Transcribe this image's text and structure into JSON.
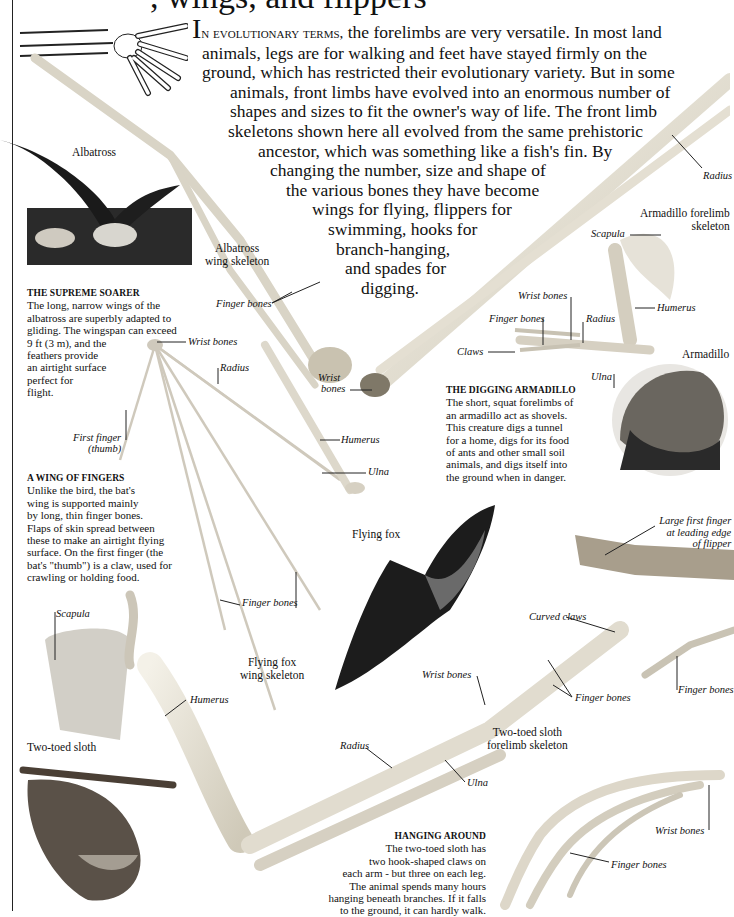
{
  "page": {
    "title_fragment": ", wings, and flippers",
    "intro": {
      "dropcap": "I",
      "lead_smallcaps": "n evolutionary terms,",
      "lines": [
        " the forelimbs are very versatile. In most land",
        "animals, legs are for walking and feet have stayed firmly on the",
        "ground, which has restricted their evolutionary variety. But in some",
        "animals, front limbs have evolved into an enormous number of",
        "shapes and sizes to fit the owner's way of life. The front limb",
        "skeletons shown here all evolved from the same prehistoric",
        "ancestor, which was something like a fish's fin. By",
        "changing the number, size and shape of",
        "the various bones they have become",
        "wings for flying, flippers for",
        "swimming, hooks for",
        "branch-hanging,",
        "and spades for",
        "digging."
      ]
    },
    "boxes": {
      "albatross": {
        "heading": "THE SUPREME SOARER",
        "lines": [
          "The long, narrow wings of the",
          "albatross are superbly adapted to",
          "gliding. The wingspan can exceed",
          "9 ft (3 m), and the",
          "feathers provide",
          "an airtight surface",
          "perfect for",
          "flight."
        ]
      },
      "bat": {
        "heading": "A WING OF FINGERS",
        "lines": [
          "Unlike the bird, the bat's",
          "wing is supported mainly",
          "by long, thin finger bones.",
          "Flaps of skin spread between",
          "these to make an airtight flying",
          "surface. On the first finger (the",
          "bat's \"thumb\") is a claw, used for",
          "crawling or holding food."
        ]
      },
      "armadillo": {
        "heading": "THE DIGGING ARMADILLO",
        "lines": [
          "The short, squat forelimbs of",
          "an armadillo act as shovels.",
          "This creature digs a tunnel",
          "for a home, digs for its food",
          "of ants and other small soil",
          "animals, and digs itself into",
          "the ground when in danger."
        ]
      },
      "sloth": {
        "heading": "HANGING AROUND",
        "lines": [
          "The two-toed sloth has",
          "two hook-shaped claws on",
          "each arm - but three on each leg.",
          "The animal spends many hours",
          "hanging beneath branches. If it falls",
          "to the ground, it can hardly walk."
        ]
      }
    },
    "captions": {
      "albatross": "Albatross",
      "albatross_skeleton_1": "Albatross",
      "albatross_skeleton_2": "wing skeleton",
      "armadillo_skeleton_1": "Armadillo forelimb",
      "armadillo_skeleton_2": "skeleton",
      "armadillo": "Armadillo",
      "flying_fox": "Flying fox",
      "flying_fox_skeleton_1": "Flying fox",
      "flying_fox_skeleton_2": "wing skeleton",
      "sloth": "Two-toed sloth",
      "sloth_skeleton_1": "Two-toed sloth",
      "sloth_skeleton_2": "forelimb skeleton"
    },
    "labels": {
      "albatross_finger_bones": "Finger bones",
      "albatross_wrist_bones_1": "Wrist",
      "albatross_wrist_bones_2": "bones",
      "albatross_radius": "Radius",
      "bat_wrist_bones": "Wrist bones",
      "bat_radius": "Radius",
      "bat_first_finger_1": "First finger",
      "bat_first_finger_2": "(thumb)",
      "bat_humerus": "Humerus",
      "bat_ulna": "Ulna",
      "bat_finger_bones": "Finger bones",
      "armadillo_scapula": "Scapula",
      "armadillo_wrist_bones": "Wrist bones",
      "armadillo_finger_bones": "Finger bones",
      "armadillo_radius": "Radius",
      "armadillo_humerus": "Humerus",
      "armadillo_claws": "Claws",
      "armadillo_ulna": "Ulna",
      "flipper_first_finger_1": "Large first finger",
      "flipper_first_finger_2": "at leading edge",
      "flipper_first_finger_3": "of flipper",
      "flipper_finger_bones": "Finger bones",
      "sloth_scapula": "Scapula",
      "sloth_humerus": "Humerus",
      "sloth_curved_claws": "Curved claws",
      "sloth_wrist_bones": "Wrist bones",
      "sloth_finger_bones": "Finger bones",
      "sloth_radius": "Radius",
      "sloth_ulna": "Ulna",
      "hand_wrist_bones": "Wrist bones",
      "hand_finger_bones": "Finger bones"
    }
  }
}
